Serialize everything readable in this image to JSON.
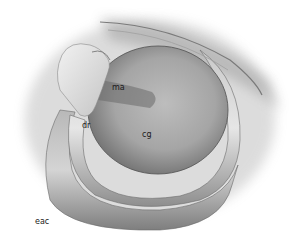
{
  "figure": {
    "labels": [
      {
        "id": "ma",
        "text": "ma",
        "x": 112,
        "y": 84
      },
      {
        "id": "dr",
        "text": "dr",
        "x": 82,
        "y": 122
      },
      {
        "id": "cg",
        "text": "cg",
        "x": 142,
        "y": 131
      },
      {
        "id": "eac",
        "text": "eac",
        "x": 35,
        "y": 218
      }
    ],
    "colors": {
      "background": "#ffffff",
      "tone_dark": "#5a5a5a",
      "tone_mid": "#9a9a9a",
      "tone_light": "#d8d8d8",
      "label": "#1a1a1a"
    }
  }
}
